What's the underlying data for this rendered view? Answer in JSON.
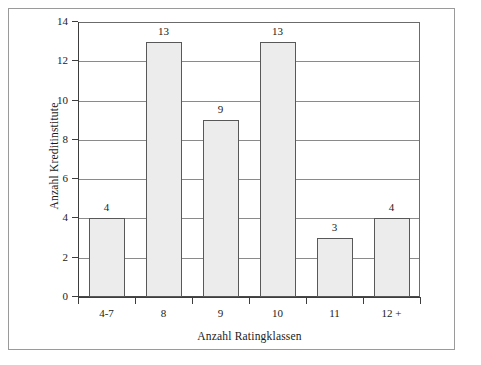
{
  "chart_data": {
    "type": "bar",
    "title": "",
    "subtitle": "",
    "xlabel": "Anzahl Ratingklassen",
    "ylabel": "Anzahl Kreditinstitute",
    "categories": [
      "4-7",
      "8",
      "9",
      "10",
      "11",
      "12 +"
    ],
    "values": [
      4,
      13,
      9,
      13,
      3,
      4
    ],
    "value_labels": [
      "4",
      "13",
      "9",
      "13",
      "3",
      "4"
    ],
    "ylim": [
      0,
      14
    ],
    "ytick_labels": [
      "0",
      "2",
      "4",
      "6",
      "8",
      "10",
      "12",
      "14"
    ],
    "ytick_values": [
      0,
      2,
      4,
      6,
      8,
      10,
      12,
      14
    ],
    "grid": "horizontal",
    "legend": "none",
    "colors": {
      "bar_fill": "#ececec",
      "bar_stroke": "#585858",
      "gridline": "#8a8a8a",
      "axis": "#3d3d3d",
      "frame": "#9a9a9a",
      "text": "#1a1a1a",
      "background": "#ffffff"
    }
  }
}
